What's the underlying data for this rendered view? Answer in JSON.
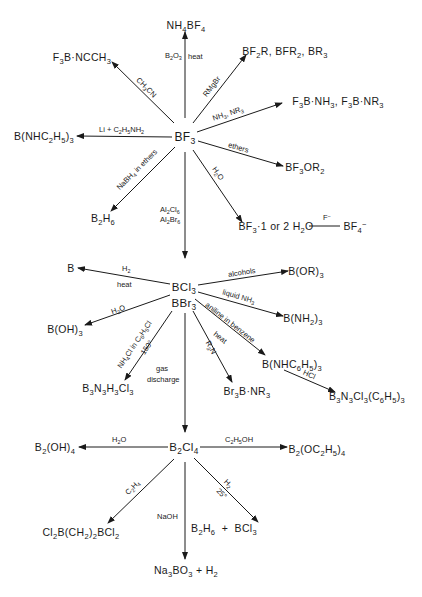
{
  "nodes": {
    "bf3": "BF<sub>3</sub>",
    "nh4bf4": "NH<sub>4</sub>BF<sub>4</sub>",
    "f3b_ncch3": "F<sub>3</sub>B·NCCH<sub>3</sub>",
    "bf2r": "BF<sub>2</sub>R, BFR<sub>2</sub>, BR<sub>3</sub>",
    "f3b_nh3": "F<sub>3</sub>B·NH<sub>3</sub>, F<sub>3</sub>B·NR<sub>3</sub>",
    "b_nhc2h5": "B(NHC<sub>2</sub>H<sub>5</sub>)<sub>3</sub>",
    "bf3or2": "BF<sub>3</sub>OR<sub>2</sub>",
    "b2h6_top": "B<sub>2</sub>H<sub>6</sub>",
    "bf3_h2o": "BF<sub>3</sub>·1 or 2 H<sub>2</sub>O",
    "bf4": "BF<sub>4</sub><sup>−</sup>",
    "bcl3": "BCl<sub>3</sub>",
    "bbr3": "BBr<sub>3</sub>",
    "b": "B",
    "b_or3": "B(OR)<sub>3</sub>",
    "b_nh2": "B(NH<sub>2</sub>)<sub>3</sub>",
    "b_nhc6h5": "B(NHC<sub>6</sub>H<sub>5</sub>)<sub>3</sub>",
    "b3n3cl3": "B<sub>3</sub>N<sub>3</sub>Cl<sub>3</sub>(C<sub>6</sub>H<sub>5</sub>)<sub>3</sub>",
    "b_oh3": "B(OH)<sub>3</sub>",
    "b3n3h3cl3": "B<sub>3</sub>N<sub>3</sub>H<sub>3</sub>Cl<sub>3</sub>",
    "br3b_nr3": "Br<sub>3</sub>B·NR<sub>3</sub>",
    "b2cl4": "B<sub>2</sub>Cl<sub>4</sub>",
    "b2_oh4": "B<sub>2</sub>(OH)<sub>4</sub>",
    "b2_oc2h5": "B<sub>2</sub>(OC<sub>2</sub>H<sub>5</sub>)<sub>4</sub>",
    "cl2b_ch2": "Cl<sub>2</sub>B(CH<sub>2</sub>)<sub>2</sub>BCl<sub>2</sub>",
    "b2h6_bcl3": "B<sub>2</sub>H<sub>6</sub> &nbsp;+ &nbsp;BCl<sub>3</sub>",
    "na3bo3": "Na<sub>3</sub>BO<sub>3</sub> + H<sub>2</sub>"
  },
  "labels": {
    "b2o3": "B<sub>2</sub>O<sub>3</sub>",
    "heat": "heat",
    "ch3cn": "CH<sub>3</sub>CN",
    "rmgbr": "RMgBr",
    "nh3_nr3": "NH<sub>3</sub>, NR<sub>3</sub>",
    "li_c2h5nh2": "Li + C<sub>2</sub>H<sub>5</sub>NH<sub>2</sub>",
    "ethers": "ethers",
    "nabh4": "NaBH<sub>4</sub> in ethers",
    "h2o_bf3": "H<sub>2</sub>O",
    "al2cl6": "Al<sub>2</sub>Cl<sub>6</sub>",
    "al2br6": "Al<sub>2</sub>Br<sub>6</sub>",
    "f_minus": "F<sup>−</sup>",
    "h2": "H<sub>2</sub>",
    "heat_b": "heat",
    "alcohols": "alcohols",
    "liquid_nh3": "liquid NH<sub>3</sub>",
    "aniline": "aniline in benzene",
    "heat_an": "heat",
    "hcl": "HCl",
    "h2o_bcl3": "H<sub>2</sub>O",
    "nh4cl": "NH<sub>4</sub>Cl in C<sub>6</sub>H<sub>5</sub>Cl",
    "t150": "150°",
    "r3n": "R<sub>3</sub>N",
    "gas": "gas",
    "discharge": "discharge",
    "h2o_b2cl4": "H<sub>2</sub>O",
    "c2h5oh": "C<sub>2</sub>H<sub>5</sub>OH",
    "c2h4": "C<sub>2</sub>H<sub>4</sub>",
    "naoh": "NaOH",
    "h2_b2cl4": "H<sub>2</sub>",
    "t25": "25°"
  }
}
